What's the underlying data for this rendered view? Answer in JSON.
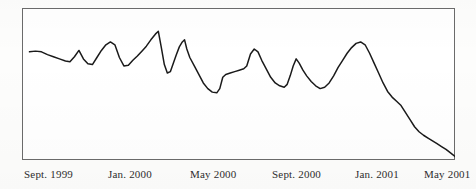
{
  "figure": {
    "background_color": "#fdfdfc",
    "frame_color": "#6b6b6b",
    "line_color": "#1a1a1a"
  },
  "axis": {
    "labels": [
      {
        "text": "Sept. 1999",
        "x": 24
      },
      {
        "text": "Jan. 2000",
        "x": 108
      },
      {
        "text": "May 2000",
        "x": 190
      },
      {
        "text": "Sept. 2000",
        "x": 272
      },
      {
        "text": "Jan. 2001",
        "x": 355
      },
      {
        "text": "May 2001",
        "x": 424
      }
    ]
  },
  "chart_data": {
    "type": "line",
    "title": "",
    "subtitle": "",
    "xlabel": "",
    "ylabel": "",
    "grid": false,
    "legend": null,
    "axis_visible": {
      "frame_box": true,
      "y_ticks": false,
      "x_ticks": false
    },
    "xlim": [
      0,
      433
    ],
    "ylim": [
      0,
      152
    ],
    "x_tick_labels": [
      "Sept. 1999",
      "Jan. 2000",
      "May 2000",
      "Sept. 2000",
      "Jan. 2001",
      "May 2001"
    ],
    "series": [
      {
        "name": "series-1",
        "color": "#1a1a1a",
        "points": [
          [
            10,
            62
          ],
          [
            18,
            61
          ],
          [
            26,
            62
          ],
          [
            34,
            66
          ],
          [
            42,
            69
          ],
          [
            50,
            72
          ],
          [
            58,
            75
          ],
          [
            64,
            76
          ],
          [
            70,
            69
          ],
          [
            76,
            60
          ],
          [
            82,
            72
          ],
          [
            88,
            79
          ],
          [
            94,
            80
          ],
          [
            100,
            70
          ],
          [
            106,
            60
          ],
          [
            112,
            52
          ],
          [
            118,
            48
          ],
          [
            124,
            52
          ],
          [
            130,
            70
          ],
          [
            136,
            82
          ],
          [
            142,
            81
          ],
          [
            148,
            74
          ],
          [
            154,
            68
          ],
          [
            160,
            61
          ],
          [
            166,
            54
          ],
          [
            172,
            45
          ],
          [
            178,
            37
          ],
          [
            182,
            33
          ],
          [
            186,
            56
          ],
          [
            190,
            80
          ],
          [
            194,
            92
          ],
          [
            198,
            90
          ],
          [
            202,
            78
          ],
          [
            206,
            66
          ],
          [
            210,
            55
          ],
          [
            214,
            48
          ],
          [
            217,
            45
          ],
          [
            220,
            58
          ],
          [
            224,
            70
          ],
          [
            230,
            82
          ],
          [
            236,
            94
          ],
          [
            242,
            106
          ],
          [
            248,
            114
          ],
          [
            254,
            119
          ],
          [
            260,
            120
          ],
          [
            264,
            114
          ],
          [
            268,
            98
          ],
          [
            272,
            94
          ],
          [
            278,
            92
          ],
          [
            284,
            90
          ],
          [
            290,
            88
          ],
          [
            296,
            86
          ],
          [
            300,
            82
          ],
          [
            305,
            65
          ],
          [
            310,
            58
          ],
          [
            315,
            62
          ],
          [
            320,
            74
          ],
          [
            326,
            86
          ],
          [
            332,
            98
          ],
          [
            338,
            106
          ],
          [
            344,
            110
          ],
          [
            350,
            112
          ],
          [
            354,
            108
          ],
          [
            358,
            96
          ],
          [
            362,
            82
          ],
          [
            366,
            72
          ],
          [
            370,
            78
          ],
          [
            375,
            88
          ],
          [
            380,
            96
          ],
          [
            386,
            104
          ],
          [
            392,
            110
          ],
          [
            398,
            114
          ],
          [
            404,
            112
          ],
          [
            410,
            106
          ],
          [
            416,
            96
          ],
          [
            422,
            84
          ],
          [
            428,
            74
          ],
          [
            434,
            64
          ],
          [
            440,
            56
          ],
          [
            446,
            50
          ],
          [
            452,
            48
          ],
          [
            458,
            52
          ],
          [
            464,
            64
          ],
          [
            470,
            78
          ],
          [
            476,
            92
          ],
          [
            482,
            106
          ],
          [
            488,
            118
          ],
          [
            494,
            126
          ],
          [
            500,
            132
          ],
          [
            506,
            138
          ],
          [
            512,
            148
          ],
          [
            518,
            158
          ],
          [
            524,
            168
          ],
          [
            530,
            175
          ],
          [
            536,
            180
          ],
          [
            542,
            184
          ],
          [
            548,
            188
          ],
          [
            554,
            192
          ],
          [
            560,
            196
          ],
          [
            566,
            200
          ],
          [
            572,
            205
          ],
          [
            578,
            210
          ]
        ]
      }
    ],
    "features": {
      "max_peak_x_approx": "Dec. 1999",
      "min_trough_x_approx": "Apr. 2001",
      "trend": "volatile-then-decline-then-recover"
    }
  }
}
